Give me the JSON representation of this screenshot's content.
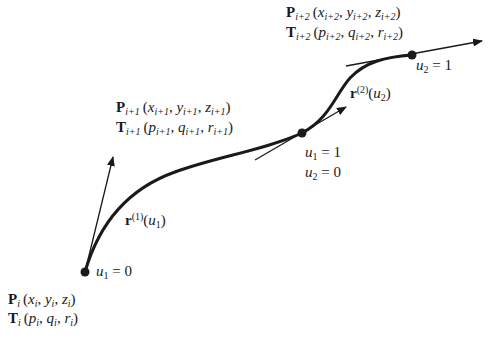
{
  "diagram": {
    "points": [
      {
        "id": "Pi",
        "x": 85,
        "y": 272,
        "param_label": "u1 = 0"
      },
      {
        "id": "Pi1",
        "x": 302,
        "y": 133,
        "param_label": "u1 = 1, u2 = 0"
      },
      {
        "id": "Pi2",
        "x": 412,
        "y": 55,
        "param_label": "u2 = 1"
      }
    ],
    "tangents": [
      {
        "from": [
          85,
          272
        ],
        "to": [
          113,
          157
        ]
      },
      {
        "from": [
          255,
          160
        ],
        "to": [
          346,
          107
        ]
      },
      {
        "from": [
          346,
          66
        ],
        "to": [
          482,
          41
        ]
      }
    ],
    "segments": [
      {
        "name": "r(1)(u1)",
        "label_sup": "(1)",
        "label_var": "u",
        "label_sub": "1"
      },
      {
        "name": "r(2)(u2)",
        "label_sup": "(2)",
        "label_var": "u",
        "label_sub": "2"
      }
    ]
  },
  "labels": {
    "p_i": {
      "bold": "P",
      "sub": "i",
      "coords": [
        {
          "v": "x",
          "s": "i"
        },
        {
          "v": "y",
          "s": "i"
        },
        {
          "v": "z",
          "s": "i"
        }
      ]
    },
    "t_i": {
      "bold": "T",
      "sub": "i",
      "coords": [
        {
          "v": "p",
          "s": "i"
        },
        {
          "v": "q",
          "s": "i"
        },
        {
          "v": "r",
          "s": "i"
        }
      ]
    },
    "p_i1": {
      "bold": "P",
      "sub": "i+1",
      "coords": [
        {
          "v": "x",
          "s": "i+1"
        },
        {
          "v": "y",
          "s": "i+1"
        },
        {
          "v": "z",
          "s": "i+1"
        }
      ]
    },
    "t_i1": {
      "bold": "T",
      "sub": "i+1",
      "coords": [
        {
          "v": "p",
          "s": "i+1"
        },
        {
          "v": "q",
          "s": "i+1"
        },
        {
          "v": "r",
          "s": "i+1"
        }
      ]
    },
    "p_i2": {
      "bold": "P",
      "sub": "i+2",
      "coords": [
        {
          "v": "x",
          "s": "i+2"
        },
        {
          "v": "y",
          "s": "i+2"
        },
        {
          "v": "z",
          "s": "i+2"
        }
      ]
    },
    "t_i2": {
      "bold": "T",
      "sub": "i+2",
      "coords": [
        {
          "v": "p",
          "s": "i+2"
        },
        {
          "v": "q",
          "s": "i+2"
        },
        {
          "v": "r",
          "s": "i+2"
        }
      ]
    },
    "u1_0": {
      "var": "u",
      "sub": "1",
      "eq": " = 0"
    },
    "u1_1": {
      "var": "u",
      "sub": "1",
      "eq": " = 1"
    },
    "u2_0": {
      "var": "u",
      "sub": "2",
      "eq": " = 0"
    },
    "u2_1": {
      "var": "u",
      "sub": "2",
      "eq": " = 1"
    },
    "r1": {
      "bold": "r",
      "sup": "(1)",
      "var": "u",
      "sub": "1"
    },
    "r2": {
      "bold": "r",
      "sup": "(2)",
      "var": "u",
      "sub": "2"
    },
    "open_paren": "(",
    "close_paren": ")",
    "comma": ", "
  }
}
